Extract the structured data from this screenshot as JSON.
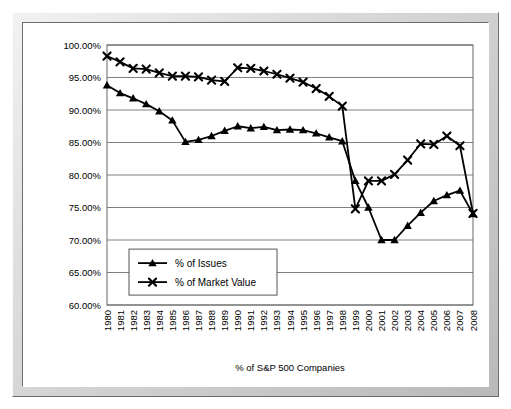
{
  "chart_data": {
    "type": "line",
    "title": "",
    "xlabel": "% of S&P 500 Companies",
    "ylabel": "",
    "ylim": [
      60,
      100
    ],
    "ytick_labels": [
      "100.00%",
      "95.00%",
      "90.00%",
      "85.00%",
      "80.00%",
      "75.00%",
      "70.00%",
      "65.00%",
      "60.00%"
    ],
    "ytick_values": [
      100,
      95,
      90,
      85,
      80,
      75,
      70,
      65,
      60
    ],
    "grid": true,
    "legend_position": "lower-left-inside",
    "categories": [
      "1980",
      "1981",
      "1982",
      "1983",
      "1984",
      "1985",
      "1986",
      "1987",
      "1988",
      "1989",
      "1990",
      "1991",
      "1992",
      "1993",
      "1994",
      "1995",
      "1996",
      "1997",
      "1998",
      "1999",
      "2000",
      "2001",
      "2002",
      "2003",
      "2004",
      "2005",
      "2006",
      "2007",
      "2008"
    ],
    "series": [
      {
        "name": "% of Issues",
        "marker": "triangle",
        "color": "#000000",
        "values": [
          93.8,
          92.6,
          91.8,
          90.9,
          89.8,
          88.4,
          85.1,
          85.4,
          86.0,
          86.8,
          87.5,
          87.2,
          87.4,
          86.9,
          87.0,
          86.9,
          86.4,
          85.8,
          85.2,
          79.1,
          75.0,
          70.0,
          70.0,
          72.2,
          74.2,
          76.0,
          76.9,
          77.6,
          74.0
        ]
      },
      {
        "name": "% of Market Value",
        "marker": "cross",
        "color": "#000000",
        "values": [
          98.3,
          97.4,
          96.4,
          96.3,
          95.7,
          95.2,
          95.2,
          95.1,
          94.6,
          94.4,
          96.5,
          96.4,
          96.0,
          95.5,
          94.9,
          94.3,
          93.3,
          92.1,
          90.6,
          74.8,
          79.1,
          79.1,
          80.1,
          82.3,
          84.8,
          84.7,
          86.0,
          84.5,
          74.1
        ]
      }
    ]
  },
  "legend": {
    "items": [
      {
        "label": "% of Issues"
      },
      {
        "label": "% of Market Value"
      }
    ]
  }
}
